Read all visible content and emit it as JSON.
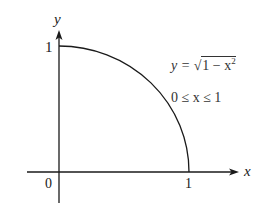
{
  "diagram": {
    "type": "function-graph",
    "axes": {
      "x_label": "x",
      "y_label": "y",
      "origin_label": "0",
      "x_tick_label": "1",
      "y_tick_label": "1"
    },
    "curve": {
      "description": "quarter circle from (0,1) to (1,0)",
      "equation_lhs": "y =",
      "sqrt_symbol": "√",
      "radicand_base": "1 − x",
      "radicand_exponent": "2",
      "domain": "0 ≤ x ≤ 1"
    },
    "colors": {
      "stroke": "#1a1a1a",
      "text": "#1a1a1a",
      "background": "#ffffff"
    }
  }
}
